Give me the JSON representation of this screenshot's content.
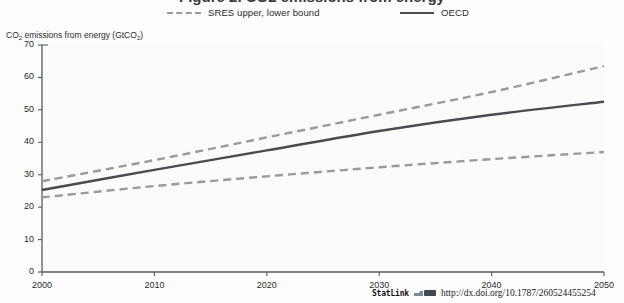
{
  "figure": {
    "title_partial": "Figure 2. CO2 emissions from energy",
    "axis_caption_main": "CO",
    "axis_caption_sub1": "2",
    "axis_caption_rest": " emissions from energy (GtCO",
    "axis_caption_sub2": "2",
    "axis_caption_end": ")"
  },
  "legend": {
    "entries": [
      {
        "label": "SRES upper, lower bound",
        "style": "dashed",
        "color": "#9a9a9a"
      },
      {
        "label": "OECD",
        "style": "solid",
        "color": "#4a4a55"
      }
    ]
  },
  "footer": {
    "statlink_label": "StatLink",
    "url": "http://dx.doi.org/10.1787/260524455254"
  },
  "chart_data": {
    "type": "line",
    "title": "CO2 emissions from energy (GtCO2)",
    "xlabel": "",
    "ylabel": "CO2 emissions from energy (GtCO2)",
    "x": [
      2000,
      2010,
      2020,
      2030,
      2040,
      2050
    ],
    "xlim": [
      2000,
      2050
    ],
    "ylim": [
      0,
      70
    ],
    "yticks": [
      0,
      10,
      20,
      30,
      40,
      50,
      60,
      70
    ],
    "xticks": [
      2000,
      2010,
      2020,
      2030,
      2040,
      2050
    ],
    "grid": false,
    "legend_position": "top",
    "series": [
      {
        "name": "SRES upper bound",
        "style": "dashed",
        "color": "#9a9a9a",
        "values": [
          28.0,
          34.5,
          41.5,
          48.5,
          55.5,
          63.5
        ]
      },
      {
        "name": "OECD",
        "style": "solid",
        "color": "#4a4a55",
        "values": [
          25.3,
          31.5,
          37.5,
          43.5,
          48.5,
          52.5
        ]
      },
      {
        "name": "SRES lower bound",
        "style": "dashed",
        "color": "#9a9a9a",
        "values": [
          23.0,
          26.5,
          29.5,
          32.3,
          34.8,
          37.0
        ]
      }
    ]
  }
}
